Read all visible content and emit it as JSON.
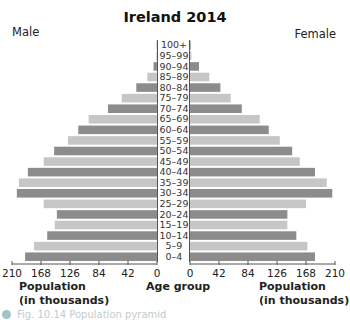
{
  "chart_data": {
    "type": "bar",
    "subtype": "population-pyramid",
    "title": "Ireland 2014",
    "left_label": "Male",
    "right_label": "Female",
    "categories": [
      "100+",
      "95–99",
      "90–94",
      "85–89",
      "80–84",
      "75–79",
      "70–74",
      "65–69",
      "60–64",
      "55–59",
      "50–54",
      "45–49",
      "40–44",
      "35–39",
      "30–34",
      "25–29",
      "20–24",
      "15–19",
      "10–14",
      "5–9",
      "0–4"
    ],
    "series": [
      {
        "name": "Male",
        "values": [
          0.5,
          1,
          5,
          14,
          30,
          51,
          71,
          99,
          114,
          129,
          149,
          164,
          187,
          200,
          203,
          164,
          145,
          148,
          159,
          178,
          191
        ]
      },
      {
        "name": "Female",
        "values": [
          1,
          2,
          13,
          28,
          44,
          59,
          75,
          101,
          114,
          130,
          148,
          159,
          181,
          198,
          206,
          168,
          141,
          141,
          154,
          170,
          181
        ]
      }
    ],
    "xlabel_left": "Population\n(in thousands)",
    "xlabel_center": "Age group",
    "xlabel_right": "Population\n(in thousands)",
    "xlim": [
      0,
      210
    ],
    "ticks": [
      0,
      42,
      84,
      126,
      168,
      210
    ],
    "tick_labels": [
      "0",
      "42",
      "84",
      "126",
      "168",
      "210"
    ],
    "colors": {
      "dark": "#8c8c8c",
      "light": "#c6c6c6",
      "axis": "#555555"
    },
    "grid": false
  },
  "labels": {
    "pop_left_line1": "Population",
    "pop_left_line2": "(in thousands)",
    "pop_right_line1": "Population",
    "pop_right_line2": "(in thousands)",
    "age_group": "Age group",
    "caption": "Fig. 10.14 Population pyramid"
  }
}
